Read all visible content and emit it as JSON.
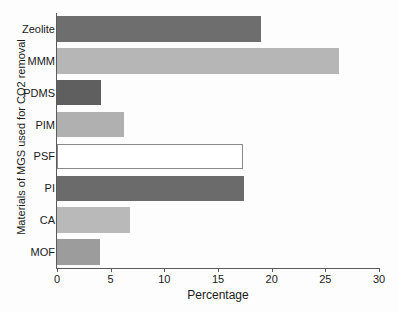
{
  "chart_data": {
    "type": "bar",
    "orientation": "horizontal",
    "title": "",
    "xlabel": "Percentage",
    "ylabel": "Materials of MGS used for CO2 removal",
    "categories": [
      "Zeolite",
      "MMM",
      "PDMS",
      "PIM",
      "PSF",
      "PI",
      "CA",
      "MOF"
    ],
    "values": [
      19.0,
      26.3,
      4.1,
      6.2,
      17.3,
      17.4,
      6.8,
      4.0
    ],
    "bar_colors": [
      "#6e6e6e",
      "#b6b6b6",
      "#5f5f5f",
      "#b0b0b0",
      "#ffffff",
      "#6b6b6b",
      "#b9b9b9",
      "#9c9c9c"
    ],
    "bar_edge_colors": [
      "#6e6e6e",
      "#b6b6b6",
      "#5f5f5f",
      "#b0b0b0",
      "#8a8a8a",
      "#6b6b6b",
      "#b9b9b9",
      "#9c9c9c"
    ],
    "xlim": [
      0,
      30
    ],
    "xticks": [
      0,
      5,
      10,
      15,
      20,
      25,
      30
    ],
    "xtick_labels": [
      "0",
      "5",
      "10",
      "15",
      "20",
      "25",
      "30"
    ],
    "grid": false,
    "legend": false
  },
  "axis": {
    "x_title": "Percentage",
    "y_title": "Materials of MGS used for CO2 removal"
  }
}
